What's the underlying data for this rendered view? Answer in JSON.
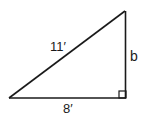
{
  "diagram": {
    "type": "right-triangle",
    "vertices": {
      "left": [
        9,
        98
      ],
      "top_right": [
        125,
        11
      ],
      "right_angle": [
        126,
        98
      ]
    },
    "right_angle_marker_size": 7,
    "stroke_color": "#1a1a1a",
    "labels": {
      "hypotenuse": "11′",
      "base": "8′",
      "height": "b"
    }
  }
}
